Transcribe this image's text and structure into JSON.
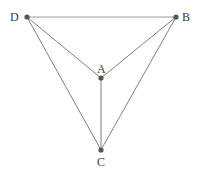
{
  "figure": {
    "type": "graph-diagram",
    "title": "",
    "background_color": "#ffffff",
    "edge_color": "#808080",
    "top_edge_color": "#999999",
    "vertex_color": "#555555",
    "label_color": "#3a3a3a",
    "edge_width": 1,
    "vertex_radius": 2.6,
    "width": 201,
    "height": 178
  },
  "chart_data": {
    "type": "diagram",
    "subtype": "undirected-graph",
    "title": "",
    "nodes": [
      {
        "id": "D",
        "label": "D",
        "x": 27,
        "y": 17,
        "label_x": 10,
        "label_y": 11,
        "label_position": "left"
      },
      {
        "id": "B",
        "label": "B",
        "x": 176,
        "y": 17,
        "label_x": 182,
        "label_y": 11,
        "label_position": "right"
      },
      {
        "id": "A",
        "label": "A",
        "x": 101,
        "y": 78,
        "label_x": 97,
        "label_y": 63,
        "label_position": "above"
      },
      {
        "id": "C",
        "label": "C",
        "x": 101,
        "y": 150,
        "label_x": 97,
        "label_y": 156,
        "label_position": "below"
      }
    ],
    "edges": [
      {
        "id": "edge-DB",
        "from": "D",
        "to": "B",
        "label": ""
      },
      {
        "id": "edge-DA",
        "from": "D",
        "to": "A",
        "label": ""
      },
      {
        "id": "edge-DC",
        "from": "D",
        "to": "C",
        "label": ""
      },
      {
        "id": "edge-BA",
        "from": "B",
        "to": "A",
        "label": ""
      },
      {
        "id": "edge-BC",
        "from": "B",
        "to": "C",
        "label": ""
      },
      {
        "id": "edge-AC",
        "from": "A",
        "to": "C",
        "label": ""
      }
    ],
    "node_count": 4,
    "edge_count": 6,
    "xlabel": "",
    "ylabel": "",
    "legend": [],
    "grid": false
  }
}
